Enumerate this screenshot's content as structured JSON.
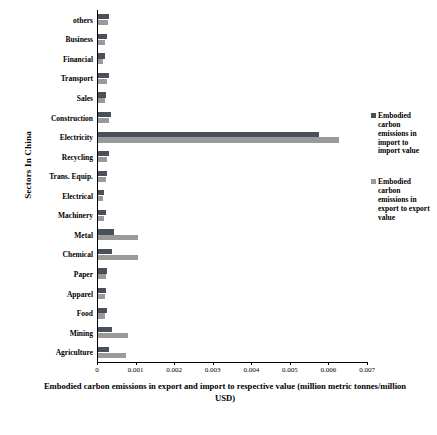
{
  "chart_data": {
    "type": "bar",
    "orientation": "horizontal",
    "title": "",
    "xlabel": "Embodied carbon emissions in export and import to respective value (million metric tonnes/million USD)",
    "ylabel": "Sectors In China",
    "xlim": [
      0,
      0.007
    ],
    "xticks": [
      0,
      0.001,
      0.002,
      0.003,
      0.004,
      0.005,
      0.006,
      0.007
    ],
    "xtick_labels": [
      "0",
      "0.001",
      "0.002",
      "0.003",
      "0.004",
      "0.005",
      "0.006",
      "0.007"
    ],
    "grid": false,
    "legend_position": "right",
    "categories": [
      "others",
      "Business",
      "Financial",
      "Transport",
      "Sales",
      "Construction",
      "Electricity",
      "Recycling",
      "Trans. Equip.",
      "Electrical",
      "Machinery",
      "Metal",
      "Chemical",
      "Paper",
      "Apparel",
      "Food",
      "Mining",
      "Agriculture"
    ],
    "series": [
      {
        "name": "Embodied carbon emissions in import to import value",
        "color": "#4a5059",
        "values": [
          0.00032,
          0.00025,
          0.0002,
          0.00031,
          0.00024,
          0.00036,
          0.00575,
          0.0003,
          0.00027,
          0.00018,
          0.00023,
          0.00043,
          0.00038,
          0.00027,
          0.00024,
          0.00025,
          0.00039,
          0.00031
        ]
      },
      {
        "name": "Embodied carbon emissions in export to export value",
        "color": "#9a9a9a",
        "values": [
          0.00028,
          0.00021,
          0.00016,
          0.00027,
          0.0002,
          0.00031,
          0.00628,
          0.00026,
          0.00023,
          0.00015,
          0.00019,
          0.00105,
          0.00105,
          0.00023,
          0.0002,
          0.00021,
          0.0008,
          0.00075
        ]
      }
    ],
    "legend": [
      {
        "label": "Embodied carbon emissions in import to import value",
        "color": "#4a5059"
      },
      {
        "label": "Embodied carbon emissions in export to export value",
        "color": "#9a9a9a"
      }
    ]
  }
}
